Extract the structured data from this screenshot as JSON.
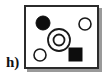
{
  "panel": {
    "label": "h)",
    "label_color": "#111111"
  },
  "frame": {
    "border_color": "#2b2b2b",
    "fill_color": "#ffffff",
    "shadow_color": "#9a9a9a",
    "x": 24,
    "y": 5,
    "width": 75,
    "height": 64
  },
  "chart_data": {
    "type": "scatter",
    "title": "h)",
    "xlabel": "",
    "ylabel": "",
    "xlim": [
      0,
      75
    ],
    "ylim": [
      0,
      64
    ],
    "grid": false,
    "legend": "none",
    "annotations": [
      "h)"
    ],
    "categories": [
      "filled-circle",
      "open-circle",
      "concentric-rings",
      "open-circle",
      "filled-square"
    ],
    "values": [
      1,
      1,
      1,
      1,
      1
    ],
    "series": [
      {
        "name": "markers",
        "values": [
          1,
          1,
          1,
          1,
          1
        ]
      }
    ],
    "points": [
      {
        "id": "filled-circle-top-left",
        "shape": "circle",
        "fill": "#0d0d0d",
        "stroke": "#0d0d0d",
        "stroke_width": 1,
        "cx": 17,
        "cy": 16,
        "r": 7
      },
      {
        "id": "open-circle-top-right",
        "shape": "circle",
        "fill": "none",
        "stroke": "#1a1a1a",
        "stroke_width": 1.6,
        "cx": 59,
        "cy": 17,
        "r": 6
      },
      {
        "id": "concentric-rings-outer",
        "shape": "circle",
        "fill": "none",
        "stroke": "#1a1a1a",
        "stroke_width": 1.8,
        "cx": 33,
        "cy": 33,
        "r": 11
      },
      {
        "id": "concentric-rings-inner",
        "shape": "circle",
        "fill": "none",
        "stroke": "#1a1a1a",
        "stroke_width": 1.8,
        "cx": 33,
        "cy": 33,
        "r": 5.5
      },
      {
        "id": "open-circle-bottom-left",
        "shape": "circle",
        "fill": "none",
        "stroke": "#1a1a1a",
        "stroke_width": 1.6,
        "cx": 14,
        "cy": 48,
        "r": 6
      },
      {
        "id": "filled-square-bottom-right",
        "shape": "square",
        "fill": "#0d0d0d",
        "stroke": "#0d0d0d",
        "stroke_width": 1,
        "x": 43,
        "y": 41,
        "size": 13
      }
    ]
  }
}
